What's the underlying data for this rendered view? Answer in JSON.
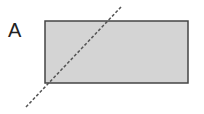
{
  "diagram": {
    "label": "A",
    "rectangle": {
      "x": 45,
      "y": 21,
      "width": 143,
      "height": 62,
      "fill": "#d4d4d4",
      "stroke": "#444444"
    },
    "dashed_line": {
      "x1": 26,
      "y1": 107,
      "x2": 121,
      "y2": 7,
      "stroke": "#555555"
    }
  }
}
